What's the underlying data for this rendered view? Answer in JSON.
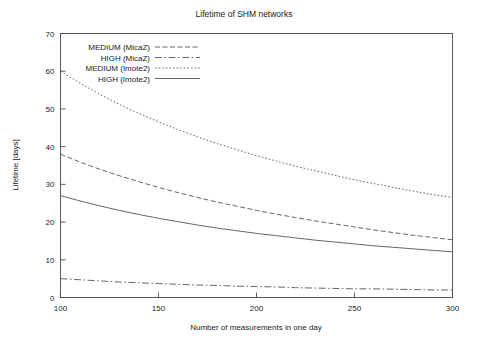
{
  "chart_data": {
    "type": "line",
    "title": "Lifetime of SHM networks",
    "xlabel": "Number of measurements in one day",
    "ylabel": "Lifetime [days]",
    "xlim": [
      100,
      300
    ],
    "ylim": [
      0,
      70
    ],
    "xticks": [
      100,
      150,
      200,
      250,
      300
    ],
    "yticks": [
      0,
      10,
      20,
      30,
      40,
      50,
      60,
      70
    ],
    "grid": false,
    "legend_position": "top-left-inside",
    "x": [
      100,
      110,
      120,
      130,
      140,
      150,
      160,
      170,
      180,
      190,
      200,
      210,
      220,
      230,
      240,
      250,
      260,
      270,
      280,
      290,
      300
    ],
    "series": [
      {
        "name": "MEDIUM (MicaZ)",
        "style": "dashed",
        "color": "#555555",
        "values": [
          38.0,
          35.9,
          34.0,
          32.3,
          30.7,
          29.2,
          27.8,
          26.5,
          25.3,
          24.2,
          23.1,
          22.1,
          21.2,
          20.3,
          19.5,
          18.7,
          17.9,
          17.2,
          16.5,
          15.9,
          15.3
        ]
      },
      {
        "name": "HIGH (MicaZ)",
        "style": "dash-dot",
        "color": "#555555",
        "values": [
          5.0,
          4.7,
          4.4,
          4.1,
          3.9,
          3.7,
          3.5,
          3.3,
          3.2,
          3.0,
          2.9,
          2.8,
          2.6,
          2.5,
          2.4,
          2.3,
          2.3,
          2.2,
          2.1,
          2.0,
          2.0
        ]
      },
      {
        "name": "MEDIUM (Imote2)",
        "style": "dotted",
        "color": "#555555",
        "values": [
          60.0,
          56.8,
          53.9,
          51.2,
          48.8,
          46.6,
          44.5,
          42.6,
          40.8,
          39.2,
          37.6,
          36.2,
          34.8,
          33.6,
          32.4,
          31.2,
          30.2,
          29.2,
          28.2,
          27.3,
          26.5
        ]
      },
      {
        "name": "HIGH (Imote2)",
        "style": "solid",
        "color": "#555555",
        "values": [
          27.0,
          25.6,
          24.3,
          23.1,
          22.0,
          21.0,
          20.1,
          19.2,
          18.4,
          17.7,
          17.0,
          16.4,
          15.8,
          15.2,
          14.7,
          14.2,
          13.7,
          13.3,
          12.9,
          12.5,
          12.1
        ]
      }
    ]
  },
  "legend": {
    "entries": [
      {
        "label": "MEDIUM (MicaZ)",
        "style": "dashed"
      },
      {
        "label": "HIGH (MicaZ)",
        "style": "dash-dot"
      },
      {
        "label": "MEDIUM (Imote2)",
        "style": "dotted"
      },
      {
        "label": "HIGH (Imote2)",
        "style": "solid"
      }
    ]
  },
  "axis": {
    "x_tick_labels": [
      "100",
      "150",
      "200",
      "250",
      "300"
    ],
    "y_tick_labels": [
      "0",
      "10",
      "20",
      "30",
      "40",
      "50",
      "60",
      "70"
    ]
  }
}
